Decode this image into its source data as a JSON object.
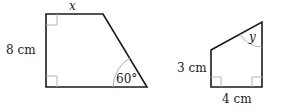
{
  "figure_a": {
    "shape": "right trapezoid",
    "top_label": "x",
    "left_label": "8 cm",
    "angle_label": "60°",
    "right_angles": 2
  },
  "figure_b": {
    "shape": "right trapezoid",
    "left_label": "3 cm",
    "bottom_label": "4 cm",
    "angle_label": "y",
    "right_angles": 2
  },
  "colors": {
    "edge": "#1a1a1a",
    "marker": "#b5b5b5"
  }
}
